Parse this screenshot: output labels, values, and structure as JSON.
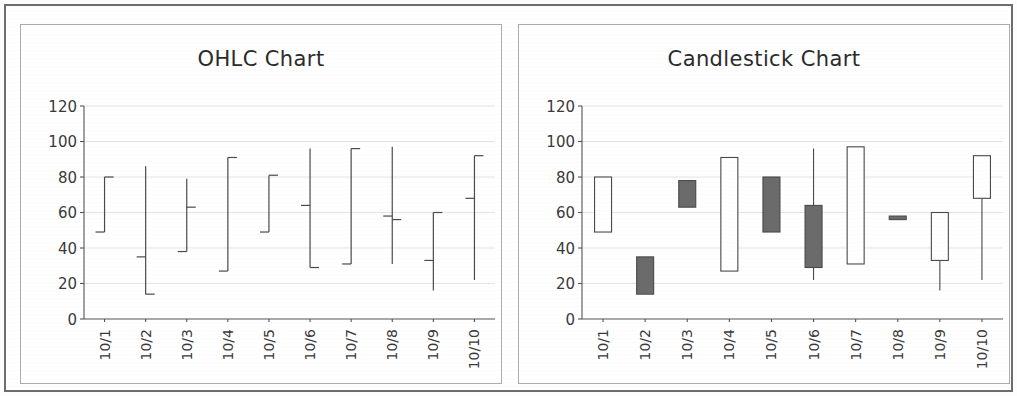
{
  "page": {
    "background_color": "#ffffff",
    "frame_color": "#6d6d6d",
    "panel_border_color": "#adadad"
  },
  "panels": [
    {
      "id": "ohlc",
      "title": "OHLC Chart"
    },
    {
      "id": "candlestick",
      "title": "Candlestick Chart"
    }
  ],
  "axis": {
    "y_ticks": [
      "0",
      "20",
      "40",
      "60",
      "80",
      "100",
      "120"
    ],
    "x_ticks": [
      "10/1",
      "10/2",
      "10/3",
      "10/4",
      "10/5",
      "10/6",
      "10/7",
      "10/8",
      "10/9",
      "10/10"
    ]
  },
  "style": {
    "gridline_color": "#dcdcdc",
    "axis_color": "#555555",
    "series_color": "#4a4a4a",
    "up_fill": "#ffffff",
    "down_fill": "#6b6b6b"
  },
  "chart_data": [
    {
      "type": "ohlc",
      "title": "OHLC Chart",
      "xlabel": "",
      "ylabel": "",
      "ylim": [
        0,
        120
      ],
      "ytick_step": 20,
      "grid": true,
      "legend": "none",
      "categories": [
        "10/1",
        "10/2",
        "10/3",
        "10/4",
        "10/5",
        "10/6",
        "10/7",
        "10/8",
        "10/9",
        "10/10"
      ],
      "series": [
        {
          "name": "Price",
          "fields": [
            "open",
            "high",
            "low",
            "close"
          ],
          "values": [
            {
              "date": "10/1",
              "open": 49,
              "high": 80,
              "low": 49,
              "close": 80
            },
            {
              "date": "10/2",
              "open": 35,
              "high": 86,
              "low": 14,
              "close": 14
            },
            {
              "date": "10/3",
              "open": 38,
              "high": 79,
              "low": 38,
              "close": 63
            },
            {
              "date": "10/4",
              "open": 27,
              "high": 91,
              "low": 27,
              "close": 91
            },
            {
              "date": "10/5",
              "open": 49,
              "high": 81,
              "low": 49,
              "close": 81
            },
            {
              "date": "10/6",
              "open": 64,
              "high": 96,
              "low": 29,
              "close": 29
            },
            {
              "date": "10/7",
              "open": 31,
              "high": 96,
              "low": 31,
              "close": 96
            },
            {
              "date": "10/8",
              "open": 58,
              "high": 97,
              "low": 31,
              "close": 56
            },
            {
              "date": "10/9",
              "open": 33,
              "high": 60,
              "low": 16,
              "close": 60
            },
            {
              "date": "10/10",
              "open": 68,
              "high": 92,
              "low": 22,
              "close": 92
            }
          ]
        }
      ]
    },
    {
      "type": "candlestick",
      "title": "Candlestick Chart",
      "xlabel": "",
      "ylabel": "",
      "ylim": [
        0,
        120
      ],
      "ytick_step": 20,
      "grid": true,
      "legend": "none",
      "categories": [
        "10/1",
        "10/2",
        "10/3",
        "10/4",
        "10/5",
        "10/6",
        "10/7",
        "10/8",
        "10/9",
        "10/10"
      ],
      "series": [
        {
          "name": "Price",
          "fields": [
            "open",
            "high",
            "low",
            "close"
          ],
          "values": [
            {
              "date": "10/1",
              "open": 49,
              "high": 80,
              "low": 49,
              "close": 80,
              "direction": "up"
            },
            {
              "date": "10/2",
              "open": 35,
              "high": 35,
              "low": 14,
              "close": 14,
              "direction": "down"
            },
            {
              "date": "10/3",
              "open": 78,
              "high": 78,
              "low": 63,
              "close": 63,
              "direction": "down"
            },
            {
              "date": "10/4",
              "open": 27,
              "high": 91,
              "low": 27,
              "close": 91,
              "direction": "up"
            },
            {
              "date": "10/5",
              "open": 80,
              "high": 80,
              "low": 49,
              "close": 49,
              "direction": "down"
            },
            {
              "date": "10/6",
              "open": 64,
              "high": 96,
              "low": 22,
              "close": 29,
              "direction": "down"
            },
            {
              "date": "10/7",
              "open": 31,
              "high": 97,
              "low": 31,
              "close": 97,
              "direction": "up"
            },
            {
              "date": "10/8",
              "open": 58,
              "high": 58,
              "low": 56,
              "close": 56,
              "direction": "down"
            },
            {
              "date": "10/9",
              "open": 33,
              "high": 60,
              "low": 16,
              "close": 60,
              "direction": "up"
            },
            {
              "date": "10/10",
              "open": 68,
              "high": 92,
              "low": 22,
              "close": 92,
              "direction": "up"
            }
          ]
        }
      ]
    }
  ]
}
